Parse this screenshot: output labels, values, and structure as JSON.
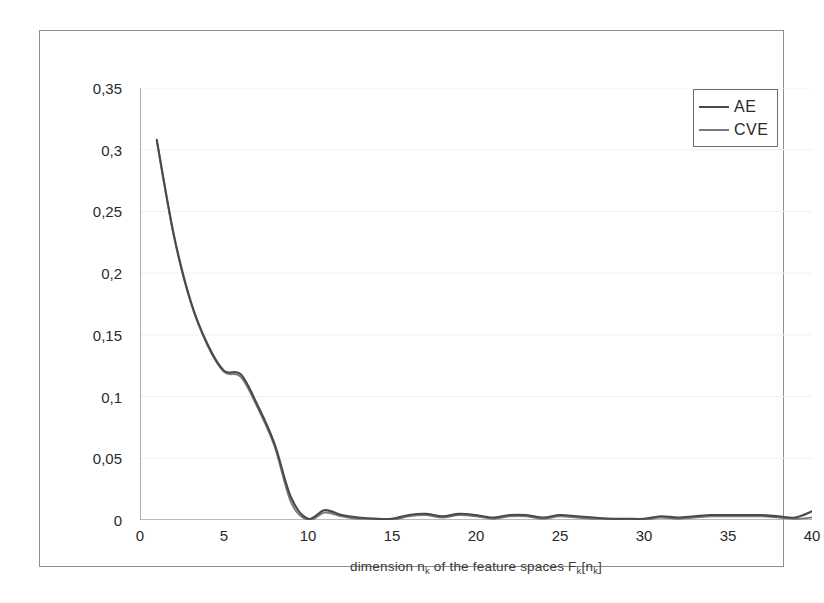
{
  "figure": {
    "background_color": "#ffffff",
    "frame_color": "#8e8e8e"
  },
  "chart_data": {
    "type": "line",
    "title": "",
    "subtitle": "",
    "xlabel": "dimension n_k of the feature spaces F_k[n_k]",
    "xlabel_parts": {
      "p1": "dimension n",
      "sub1": "k",
      "p2": " of the feature spaces F",
      "sub2": "k",
      "p3": "[n",
      "sub3": "k",
      "p4": "]"
    },
    "ylabel": "",
    "xlim": [
      0,
      40
    ],
    "ylim": [
      0,
      0.35
    ],
    "xticks": [
      0,
      5,
      10,
      15,
      20,
      25,
      30,
      35,
      40
    ],
    "xtick_labels": [
      "0",
      "5",
      "10",
      "15",
      "20",
      "25",
      "30",
      "35",
      "40"
    ],
    "yticks": [
      0,
      0.05,
      0.1,
      0.15,
      0.2,
      0.25,
      0.3,
      0.35
    ],
    "ytick_labels": [
      "0",
      "0,05",
      "0,1",
      "0,15",
      "0,2",
      "0,25",
      "0,3",
      "0,35"
    ],
    "grid": "horizontal-faint",
    "legend_position": "top-right",
    "legend_entries": [
      "AE",
      "CVE"
    ],
    "series": [
      {
        "name": "AE",
        "color": "#4a4a4a",
        "x": [
          1,
          2,
          3,
          4,
          5,
          6,
          7,
          8,
          9,
          10,
          11,
          12,
          13,
          14,
          15,
          16,
          17,
          18,
          19,
          20,
          21,
          22,
          23,
          24,
          25,
          26,
          27,
          28,
          29,
          30,
          31,
          32,
          33,
          34,
          35,
          36,
          37,
          38,
          39,
          40
        ],
        "values": [
          0.308,
          0.232,
          0.178,
          0.143,
          0.121,
          0.118,
          0.093,
          0.062,
          0.018,
          0.001,
          0.008,
          0.004,
          0.002,
          0.001,
          0.001,
          0.004,
          0.005,
          0.003,
          0.005,
          0.004,
          0.002,
          0.004,
          0.004,
          0.002,
          0.004,
          0.003,
          0.002,
          0.001,
          0.001,
          0.001,
          0.003,
          0.002,
          0.003,
          0.004,
          0.004,
          0.004,
          0.004,
          0.003,
          0.002,
          0.007
        ]
      },
      {
        "name": "CVE",
        "color": "#7a7a7a",
        "x": [
          1,
          2,
          3,
          4,
          5,
          6,
          7,
          8,
          9,
          10,
          11,
          12,
          13,
          14,
          15,
          16,
          17,
          18,
          19,
          20,
          21,
          22,
          23,
          24,
          25,
          26,
          27,
          28,
          29,
          30,
          31,
          32,
          33,
          34,
          35,
          36,
          37,
          38,
          39,
          40
        ],
        "values": [
          0.307,
          0.231,
          0.177,
          0.142,
          0.12,
          0.116,
          0.091,
          0.06,
          0.014,
          0.0,
          0.006,
          0.003,
          0.001,
          0.001,
          0.0,
          0.003,
          0.004,
          0.002,
          0.004,
          0.003,
          0.001,
          0.003,
          0.003,
          0.001,
          0.003,
          0.002,
          0.001,
          0.001,
          0.0,
          0.0,
          0.002,
          0.001,
          0.002,
          0.003,
          0.003,
          0.003,
          0.003,
          0.002,
          0.001,
          0.002
        ]
      }
    ]
  }
}
